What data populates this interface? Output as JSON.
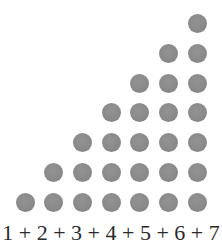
{
  "diagram": {
    "type": "triangular-number-dot-staircase",
    "columns": [
      1,
      2,
      3,
      4,
      5,
      6,
      7
    ],
    "dot_color": "#8a8a8a",
    "background_color": "#ffffff",
    "layout": {
      "first_col_center_x": 25,
      "col_spacing": 28.7,
      "bottom_row_center_y": 202,
      "row_spacing": 29.7,
      "dot_diameter": 19
    },
    "caption": "1 + 2 + 3 + 4 + 5 + 6 + 7"
  }
}
